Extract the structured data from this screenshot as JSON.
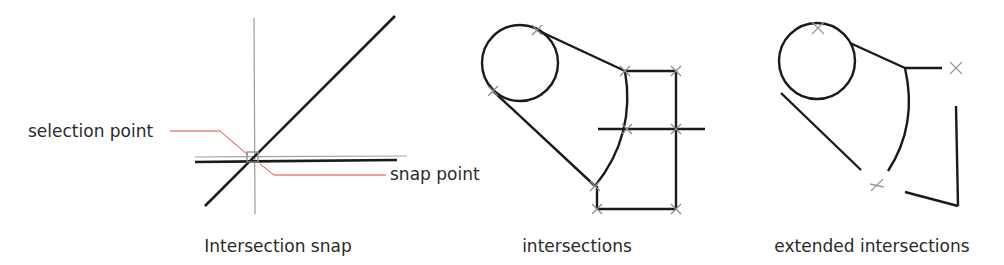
{
  "colors": {
    "geometry": "#1a1a1a",
    "construction": "#9a9a9a",
    "marker": "#8c8c8c",
    "leader": "#e0443a",
    "text": "#2a2a2a"
  },
  "panels": [
    {
      "id": "intersection-snap",
      "caption": "Intersection snap",
      "labels": {
        "selection_point": "selection point",
        "snap_point": "snap point"
      }
    },
    {
      "id": "intersections",
      "caption": "intersections",
      "marker_count": 9
    },
    {
      "id": "extended-intersections",
      "caption": "extended intersections",
      "marker_count": 3
    }
  ]
}
